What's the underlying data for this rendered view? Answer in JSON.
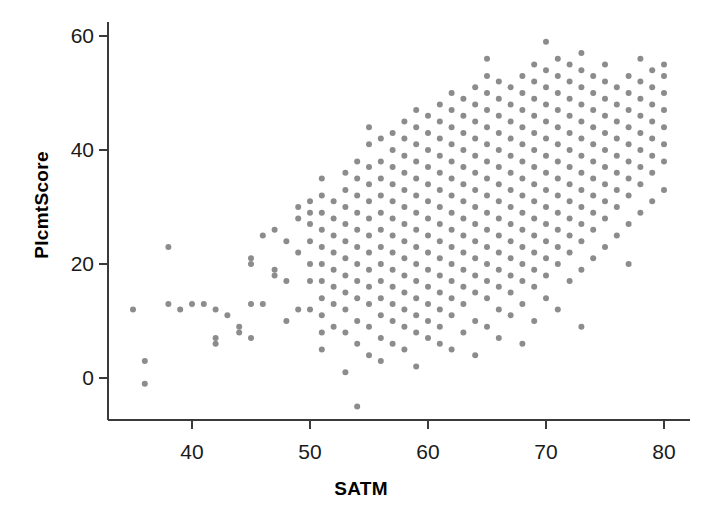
{
  "chart_data": {
    "type": "scatter",
    "title": "",
    "xlabel": "SATM",
    "ylabel": "PlcmtScore",
    "xlim": [
      33,
      81
    ],
    "ylim": [
      -7,
      62
    ],
    "xticks": [
      40,
      50,
      60,
      70,
      80
    ],
    "yticks": [
      0,
      20,
      40,
      60
    ],
    "grid": false,
    "legend": null,
    "marker": {
      "color": "#8c8c8c",
      "size_px": 6,
      "shape": "circle"
    },
    "axis_color": "#3a3a3a",
    "background": "#ffffff",
    "n_points": 1014,
    "points": [
      [
        35,
        12
      ],
      [
        36,
        3
      ],
      [
        36,
        -1
      ],
      [
        38,
        23
      ],
      [
        38,
        13
      ],
      [
        39,
        12
      ],
      [
        40,
        13
      ],
      [
        41,
        13
      ],
      [
        42,
        7
      ],
      [
        42,
        6
      ],
      [
        42,
        12
      ],
      [
        43,
        11
      ],
      [
        44,
        8
      ],
      [
        44,
        9
      ],
      [
        45,
        21
      ],
      [
        45,
        20
      ],
      [
        45,
        13
      ],
      [
        45,
        7
      ],
      [
        46,
        13
      ],
      [
        46,
        25
      ],
      [
        47,
        18
      ],
      [
        47,
        19
      ],
      [
        47,
        26
      ],
      [
        48,
        10
      ],
      [
        48,
        17
      ],
      [
        48,
        24
      ],
      [
        49,
        12
      ],
      [
        49,
        22
      ],
      [
        49,
        28
      ],
      [
        49,
        30
      ],
      [
        50,
        12
      ],
      [
        50,
        17
      ],
      [
        50,
        20
      ],
      [
        50,
        24
      ],
      [
        50,
        27
      ],
      [
        50,
        29
      ],
      [
        50,
        31
      ],
      [
        51,
        5
      ],
      [
        51,
        8
      ],
      [
        51,
        11
      ],
      [
        51,
        14
      ],
      [
        51,
        17
      ],
      [
        51,
        20
      ],
      [
        51,
        23
      ],
      [
        51,
        26
      ],
      [
        51,
        29
      ],
      [
        51,
        32
      ],
      [
        51,
        35
      ],
      [
        52,
        9
      ],
      [
        52,
        13
      ],
      [
        52,
        16
      ],
      [
        52,
        19
      ],
      [
        52,
        22
      ],
      [
        52,
        25
      ],
      [
        52,
        28
      ],
      [
        52,
        31
      ],
      [
        53,
        1
      ],
      [
        53,
        8
      ],
      [
        53,
        12
      ],
      [
        53,
        15
      ],
      [
        53,
        18
      ],
      [
        53,
        21
      ],
      [
        53,
        24
      ],
      [
        53,
        27
      ],
      [
        53,
        30
      ],
      [
        53,
        33
      ],
      [
        53,
        36
      ],
      [
        54,
        -5
      ],
      [
        54,
        6
      ],
      [
        54,
        10
      ],
      [
        54,
        14
      ],
      [
        54,
        17
      ],
      [
        54,
        20
      ],
      [
        54,
        23
      ],
      [
        54,
        26
      ],
      [
        54,
        29
      ],
      [
        54,
        32
      ],
      [
        54,
        35
      ],
      [
        54,
        38
      ],
      [
        55,
        4
      ],
      [
        55,
        9
      ],
      [
        55,
        13
      ],
      [
        55,
        16
      ],
      [
        55,
        19
      ],
      [
        55,
        22
      ],
      [
        55,
        25
      ],
      [
        55,
        28
      ],
      [
        55,
        31
      ],
      [
        55,
        34
      ],
      [
        55,
        37
      ],
      [
        55,
        41
      ],
      [
        55,
        44
      ],
      [
        56,
        3
      ],
      [
        56,
        7
      ],
      [
        56,
        11
      ],
      [
        56,
        14
      ],
      [
        56,
        17
      ],
      [
        56,
        20
      ],
      [
        56,
        23
      ],
      [
        56,
        26
      ],
      [
        56,
        29
      ],
      [
        56,
        32
      ],
      [
        56,
        35
      ],
      [
        56,
        38
      ],
      [
        56,
        42
      ],
      [
        57,
        6
      ],
      [
        57,
        10
      ],
      [
        57,
        13
      ],
      [
        57,
        16
      ],
      [
        57,
        19
      ],
      [
        57,
        22
      ],
      [
        57,
        25
      ],
      [
        57,
        28
      ],
      [
        57,
        31
      ],
      [
        57,
        34
      ],
      [
        57,
        37
      ],
      [
        57,
        40
      ],
      [
        57,
        43
      ],
      [
        58,
        5
      ],
      [
        58,
        9
      ],
      [
        58,
        12
      ],
      [
        58,
        15
      ],
      [
        58,
        18
      ],
      [
        58,
        21
      ],
      [
        58,
        24
      ],
      [
        58,
        27
      ],
      [
        58,
        30
      ],
      [
        58,
        33
      ],
      [
        58,
        36
      ],
      [
        58,
        39
      ],
      [
        58,
        42
      ],
      [
        58,
        45
      ],
      [
        59,
        2
      ],
      [
        59,
        8
      ],
      [
        59,
        11
      ],
      [
        59,
        14
      ],
      [
        59,
        17
      ],
      [
        59,
        20
      ],
      [
        59,
        23
      ],
      [
        59,
        26
      ],
      [
        59,
        29
      ],
      [
        59,
        32
      ],
      [
        59,
        35
      ],
      [
        59,
        38
      ],
      [
        59,
        41
      ],
      [
        59,
        44
      ],
      [
        59,
        47
      ],
      [
        60,
        7
      ],
      [
        60,
        10
      ],
      [
        60,
        13
      ],
      [
        60,
        16
      ],
      [
        60,
        19
      ],
      [
        60,
        22
      ],
      [
        60,
        25
      ],
      [
        60,
        28
      ],
      [
        60,
        31
      ],
      [
        60,
        34
      ],
      [
        60,
        37
      ],
      [
        60,
        40
      ],
      [
        60,
        43
      ],
      [
        60,
        46
      ],
      [
        61,
        6
      ],
      [
        61,
        9
      ],
      [
        61,
        12
      ],
      [
        61,
        15
      ],
      [
        61,
        18
      ],
      [
        61,
        21
      ],
      [
        61,
        24
      ],
      [
        61,
        27
      ],
      [
        61,
        30
      ],
      [
        61,
        33
      ],
      [
        61,
        36
      ],
      [
        61,
        39
      ],
      [
        61,
        42
      ],
      [
        61,
        45
      ],
      [
        61,
        48
      ],
      [
        62,
        5
      ],
      [
        62,
        11
      ],
      [
        62,
        14
      ],
      [
        62,
        17
      ],
      [
        62,
        20
      ],
      [
        62,
        23
      ],
      [
        62,
        26
      ],
      [
        62,
        29
      ],
      [
        62,
        32
      ],
      [
        62,
        35
      ],
      [
        62,
        38
      ],
      [
        62,
        41
      ],
      [
        62,
        44
      ],
      [
        62,
        47
      ],
      [
        62,
        50
      ],
      [
        63,
        8
      ],
      [
        63,
        13
      ],
      [
        63,
        16
      ],
      [
        63,
        19
      ],
      [
        63,
        22
      ],
      [
        63,
        25
      ],
      [
        63,
        28
      ],
      [
        63,
        31
      ],
      [
        63,
        34
      ],
      [
        63,
        37
      ],
      [
        63,
        40
      ],
      [
        63,
        43
      ],
      [
        63,
        46
      ],
      [
        63,
        49
      ],
      [
        64,
        4
      ],
      [
        64,
        10
      ],
      [
        64,
        15
      ],
      [
        64,
        18
      ],
      [
        64,
        21
      ],
      [
        64,
        24
      ],
      [
        64,
        27
      ],
      [
        64,
        30
      ],
      [
        64,
        33
      ],
      [
        64,
        36
      ],
      [
        64,
        39
      ],
      [
        64,
        42
      ],
      [
        64,
        45
      ],
      [
        64,
        48
      ],
      [
        64,
        51
      ],
      [
        65,
        9
      ],
      [
        65,
        14
      ],
      [
        65,
        17
      ],
      [
        65,
        20
      ],
      [
        65,
        23
      ],
      [
        65,
        26
      ],
      [
        65,
        29
      ],
      [
        65,
        32
      ],
      [
        65,
        35
      ],
      [
        65,
        38
      ],
      [
        65,
        41
      ],
      [
        65,
        44
      ],
      [
        65,
        47
      ],
      [
        65,
        50
      ],
      [
        65,
        53
      ],
      [
        65,
        56
      ],
      [
        66,
        7
      ],
      [
        66,
        12
      ],
      [
        66,
        16
      ],
      [
        66,
        19
      ],
      [
        66,
        22
      ],
      [
        66,
        25
      ],
      [
        66,
        28
      ],
      [
        66,
        31
      ],
      [
        66,
        34
      ],
      [
        66,
        37
      ],
      [
        66,
        40
      ],
      [
        66,
        43
      ],
      [
        66,
        46
      ],
      [
        66,
        49
      ],
      [
        66,
        52
      ],
      [
        67,
        11
      ],
      [
        67,
        15
      ],
      [
        67,
        18
      ],
      [
        67,
        21
      ],
      [
        67,
        24
      ],
      [
        67,
        27
      ],
      [
        67,
        30
      ],
      [
        67,
        33
      ],
      [
        67,
        36
      ],
      [
        67,
        39
      ],
      [
        67,
        42
      ],
      [
        67,
        45
      ],
      [
        67,
        48
      ],
      [
        67,
        51
      ],
      [
        68,
        6
      ],
      [
        68,
        13
      ],
      [
        68,
        17
      ],
      [
        68,
        20
      ],
      [
        68,
        23
      ],
      [
        68,
        26
      ],
      [
        68,
        29
      ],
      [
        68,
        32
      ],
      [
        68,
        35
      ],
      [
        68,
        38
      ],
      [
        68,
        41
      ],
      [
        68,
        44
      ],
      [
        68,
        47
      ],
      [
        68,
        50
      ],
      [
        68,
        53
      ],
      [
        69,
        10
      ],
      [
        69,
        16
      ],
      [
        69,
        19
      ],
      [
        69,
        22
      ],
      [
        69,
        25
      ],
      [
        69,
        28
      ],
      [
        69,
        31
      ],
      [
        69,
        34
      ],
      [
        69,
        37
      ],
      [
        69,
        40
      ],
      [
        69,
        43
      ],
      [
        69,
        46
      ],
      [
        69,
        49
      ],
      [
        69,
        52
      ],
      [
        69,
        55
      ],
      [
        70,
        14
      ],
      [
        70,
        18
      ],
      [
        70,
        21
      ],
      [
        70,
        24
      ],
      [
        70,
        27
      ],
      [
        70,
        30
      ],
      [
        70,
        33
      ],
      [
        70,
        36
      ],
      [
        70,
        39
      ],
      [
        70,
        42
      ],
      [
        70,
        45
      ],
      [
        70,
        48
      ],
      [
        70,
        51
      ],
      [
        70,
        54
      ],
      [
        70,
        59
      ],
      [
        71,
        12
      ],
      [
        71,
        20
      ],
      [
        71,
        23
      ],
      [
        71,
        26
      ],
      [
        71,
        29
      ],
      [
        71,
        32
      ],
      [
        71,
        35
      ],
      [
        71,
        38
      ],
      [
        71,
        41
      ],
      [
        71,
        44
      ],
      [
        71,
        47
      ],
      [
        71,
        50
      ],
      [
        71,
        53
      ],
      [
        71,
        56
      ],
      [
        72,
        17
      ],
      [
        72,
        22
      ],
      [
        72,
        25
      ],
      [
        72,
        28
      ],
      [
        72,
        31
      ],
      [
        72,
        34
      ],
      [
        72,
        37
      ],
      [
        72,
        40
      ],
      [
        72,
        43
      ],
      [
        72,
        46
      ],
      [
        72,
        49
      ],
      [
        72,
        52
      ],
      [
        72,
        55
      ],
      [
        73,
        9
      ],
      [
        73,
        19
      ],
      [
        73,
        24
      ],
      [
        73,
        27
      ],
      [
        73,
        30
      ],
      [
        73,
        33
      ],
      [
        73,
        36
      ],
      [
        73,
        39
      ],
      [
        73,
        42
      ],
      [
        73,
        45
      ],
      [
        73,
        48
      ],
      [
        73,
        51
      ],
      [
        73,
        54
      ],
      [
        73,
        57
      ],
      [
        74,
        21
      ],
      [
        74,
        26
      ],
      [
        74,
        29
      ],
      [
        74,
        32
      ],
      [
        74,
        35
      ],
      [
        74,
        38
      ],
      [
        74,
        41
      ],
      [
        74,
        44
      ],
      [
        74,
        47
      ],
      [
        74,
        50
      ],
      [
        74,
        53
      ],
      [
        75,
        23
      ],
      [
        75,
        28
      ],
      [
        75,
        31
      ],
      [
        75,
        34
      ],
      [
        75,
        37
      ],
      [
        75,
        40
      ],
      [
        75,
        43
      ],
      [
        75,
        46
      ],
      [
        75,
        49
      ],
      [
        75,
        52
      ],
      [
        75,
        55
      ],
      [
        76,
        25
      ],
      [
        76,
        30
      ],
      [
        76,
        33
      ],
      [
        76,
        36
      ],
      [
        76,
        39
      ],
      [
        76,
        42
      ],
      [
        76,
        45
      ],
      [
        76,
        48
      ],
      [
        76,
        51
      ],
      [
        77,
        20
      ],
      [
        77,
        27
      ],
      [
        77,
        32
      ],
      [
        77,
        35
      ],
      [
        77,
        38
      ],
      [
        77,
        41
      ],
      [
        77,
        44
      ],
      [
        77,
        47
      ],
      [
        77,
        50
      ],
      [
        77,
        53
      ],
      [
        78,
        29
      ],
      [
        78,
        34
      ],
      [
        78,
        37
      ],
      [
        78,
        40
      ],
      [
        78,
        43
      ],
      [
        78,
        46
      ],
      [
        78,
        49
      ],
      [
        78,
        52
      ],
      [
        78,
        56
      ],
      [
        79,
        31
      ],
      [
        79,
        36
      ],
      [
        79,
        39
      ],
      [
        79,
        42
      ],
      [
        79,
        45
      ],
      [
        79,
        48
      ],
      [
        79,
        51
      ],
      [
        79,
        54
      ],
      [
        80,
        33
      ],
      [
        80,
        38
      ],
      [
        80,
        41
      ],
      [
        80,
        44
      ],
      [
        80,
        47
      ],
      [
        80,
        50
      ],
      [
        80,
        53
      ],
      [
        80,
        55
      ]
    ]
  },
  "axes": {
    "x_tick_labels": [
      "40",
      "50",
      "60",
      "70",
      "80"
    ],
    "y_tick_labels": [
      "0",
      "20",
      "40",
      "60"
    ],
    "x_title": "SATM",
    "y_title": "PlcmtScore"
  }
}
